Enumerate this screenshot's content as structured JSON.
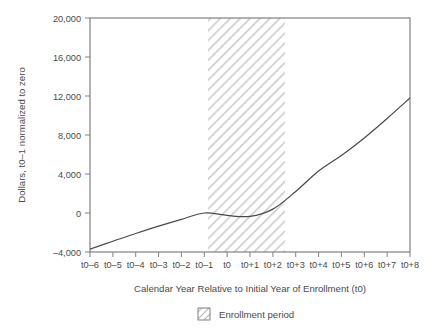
{
  "chart_data": {
    "type": "line",
    "title": "",
    "xlabel": "Calendar Year Relative to Initial Year of Enrollment (t0)",
    "ylabel": "Dollars, t0–1 normalized to zero",
    "categories": [
      "t0–6",
      "t0–5",
      "t0–4",
      "t0–3",
      "t0–2",
      "t0–1",
      "t0",
      "t0+1",
      "t0+2",
      "t0+3",
      "t0+4",
      "t0+5",
      "t0+6",
      "t0+7",
      "t0+8"
    ],
    "x_tick_labels": [
      "t0–6",
      "t0–5",
      "t0–4",
      "t0–3",
      "t0–2",
      "t0–1",
      "t0",
      "t0+1",
      "t0+2",
      "t0+3",
      "t0+4",
      "t0+5",
      "t0+6",
      "t0+7",
      "t0+8"
    ],
    "y_tick_labels": [
      "20,000",
      "16,000",
      "12,000",
      "8,000",
      "4,000",
      "0",
      "–4,000"
    ],
    "y_tick_values": [
      20000,
      16000,
      12000,
      8000,
      4000,
      0,
      -4000
    ],
    "ylim": [
      -4000,
      20000
    ],
    "xlim": [
      "t0–6",
      "t0+8"
    ],
    "grid": false,
    "legend_position": "below-axis-center",
    "series": [
      {
        "name": "Dollars, t0–1 normalized to zero",
        "color": "#4a4a4a",
        "values": [
          -3700,
          -2900,
          -2100,
          -1350,
          -650,
          0,
          -250,
          -350,
          400,
          2200,
          4300,
          5900,
          7700,
          9700,
          11800
        ]
      }
    ],
    "shaded_region": {
      "label": "Enrollment period",
      "pattern": "diagonal-hatch",
      "color": "#c8c8c8",
      "x_start": "t0–1",
      "x_end": "t0+2.4"
    },
    "annotations": []
  },
  "legend": {
    "items": [
      {
        "label": "Enrollment period",
        "swatch": "hatch-swatch-icon"
      }
    ]
  },
  "axes": {
    "y_axis_title": "Dollars, t0–1 normalized to zero",
    "x_axis_title": "Calendar Year Relative to Initial Year of Enrollment (t0)"
  },
  "colors": {
    "line": "#4a4a4a",
    "frame": "#808080",
    "hatch": "#cccccc",
    "text": "#4a4a4a",
    "background": "#ffffff"
  }
}
